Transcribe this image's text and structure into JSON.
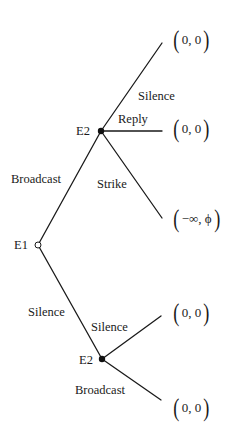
{
  "diagram": {
    "type": "extensive-form game tree",
    "top_cutoff_text": "",
    "nodes": [
      {
        "id": "root",
        "label": "E1",
        "player": "E1",
        "style": "hollow",
        "x": 38,
        "y": 245
      },
      {
        "id": "upper",
        "label": "E2",
        "player": "E2",
        "style": "filled",
        "x": 101,
        "y": 131
      },
      {
        "id": "lower",
        "label": "E2",
        "player": "E2",
        "style": "filled",
        "x": 102,
        "y": 359
      }
    ],
    "edges": [
      {
        "from": "root",
        "to": "upper",
        "label": "Broadcast"
      },
      {
        "from": "root",
        "to": "lower",
        "label": "Silence"
      },
      {
        "from": "upper",
        "to": "leaf1",
        "label": "Silence"
      },
      {
        "from": "upper",
        "to": "leaf2",
        "label": "Reply"
      },
      {
        "from": "upper",
        "to": "leaf3",
        "label": "Strike"
      },
      {
        "from": "lower",
        "to": "leaf4",
        "label": "Silence"
      },
      {
        "from": "lower",
        "to": "leaf5",
        "label": "Broadcast"
      }
    ],
    "leaves": [
      {
        "id": "leaf1",
        "payoff": "0, 0"
      },
      {
        "id": "leaf2",
        "payoff": "0, 0"
      },
      {
        "id": "leaf3",
        "payoff": "−∞, ϕ"
      },
      {
        "id": "leaf4",
        "payoff": "0, 0"
      },
      {
        "id": "leaf5",
        "payoff": "0, 0"
      }
    ]
  },
  "labels": {
    "root_node": "E1",
    "upper_node": "E2",
    "lower_node": "E2",
    "edge_root_upper": "Broadcast",
    "edge_root_lower": "Silence",
    "edge_upper_silence": "Silence",
    "edge_upper_reply": "Reply",
    "edge_upper_strike": "Strike",
    "edge_lower_silence": "Silence",
    "edge_lower_broadcast": "Broadcast"
  },
  "payoffs": {
    "upper_silence": "0, 0",
    "upper_reply": "0, 0",
    "upper_strike": "−∞, ϕ",
    "lower_silence": "0, 0",
    "lower_broadcast": "0, 0",
    "open_paren": "(",
    "close_paren": ")"
  },
  "colors": {
    "line": "#1a1a1a",
    "node_fill": "#111111",
    "background": "#ffffff"
  }
}
